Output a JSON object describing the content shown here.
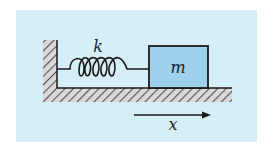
{
  "diagram": {
    "labels": {
      "spring": "k",
      "mass": "m",
      "displacement": "x"
    },
    "colors": {
      "background_panel": "#d6eef8",
      "mass_fill": "#9fd0ee",
      "stroke": "#1a1a1a",
      "hatch": "#555555"
    },
    "elements": [
      "wall",
      "floor",
      "spring",
      "mass",
      "displacement-arrow"
    ]
  }
}
